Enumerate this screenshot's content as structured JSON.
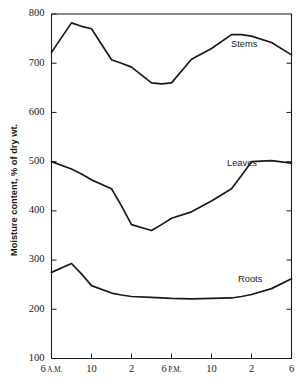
{
  "chart_data": {
    "type": "line",
    "title": "",
    "xlabel": "",
    "ylabel": "Moisture content, % of dry wt.",
    "ylim": [
      100,
      800
    ],
    "xlim": [
      6,
      30
    ],
    "grid": false,
    "legend_position": "inline-labels",
    "ytick_labels": [
      "800",
      "700",
      "600",
      "500",
      "400",
      "300",
      "200",
      "100"
    ],
    "ytick_values": [
      800,
      700,
      600,
      500,
      400,
      300,
      200,
      100
    ],
    "xtick_labels": [
      "6",
      "10",
      "2",
      "6",
      "10",
      "2",
      "6"
    ],
    "xtick_suffixes": [
      "A.M.",
      "",
      "",
      "P.M.",
      "",
      "",
      ""
    ],
    "xtick_values": [
      6,
      10,
      14,
      18,
      22,
      26,
      30
    ],
    "x": [
      6,
      8,
      9,
      10,
      12,
      13,
      14,
      16,
      17,
      18,
      20,
      22,
      24,
      25,
      26,
      28,
      30
    ],
    "series": [
      {
        "name": "Stems",
        "label": "Stems",
        "color": "#1a1a1a",
        "values": [
          722,
          782,
          775,
          770,
          707,
          700,
          692,
          660,
          658,
          660,
          708,
          730,
          758,
          758,
          755,
          742,
          717
        ]
      },
      {
        "name": "Leaves",
        "label": "Leaves",
        "color": "#1a1a1a",
        "values": [
          500,
          485,
          475,
          463,
          445,
          410,
          372,
          360,
          372,
          385,
          398,
          420,
          445,
          472,
          500,
          502,
          497
        ]
      },
      {
        "name": "Roots",
        "label": "Roots",
        "color": "#1a1a1a",
        "values": [
          275,
          293,
          272,
          248,
          233,
          229,
          226,
          224,
          223,
          222,
          221,
          222,
          223,
          226,
          230,
          242,
          262
        ]
      }
    ],
    "annotations": [
      {
        "text": "Stems",
        "x_px": 231,
        "y_px": 47
      },
      {
        "text": "Leaves",
        "x_px": 227,
        "y_px": 166
      },
      {
        "text": "Roots",
        "x_px": 238,
        "y_px": 282
      }
    ]
  }
}
